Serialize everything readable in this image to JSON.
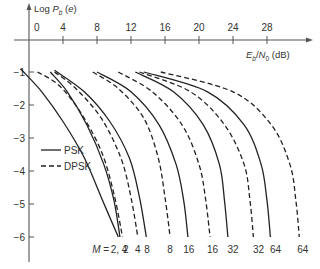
{
  "chart_data": {
    "type": "line",
    "title": "",
    "xlabel": "E_b/N_0 (dB)",
    "ylabel": "Log P_b (e)",
    "xlim": [
      0,
      32
    ],
    "ylim": [
      -6.5,
      0
    ],
    "x_ticks": [
      0,
      4,
      8,
      12,
      16,
      20,
      24,
      28
    ],
    "y_ticks": [
      -1,
      -2,
      -3,
      -4,
      -5,
      -6
    ],
    "grid": false,
    "legend": {
      "position": "left-middle",
      "entries": [
        {
          "label": "PSK",
          "style": "solid"
        },
        {
          "label": "DPSK",
          "style": "dashed"
        }
      ]
    },
    "bottom_label_prefix": "M = ",
    "series": [
      {
        "name": "PSK M=2",
        "style": "solid",
        "M": "2",
        "x": [
          -1.0,
          1.5,
          4.0,
          6.5,
          8.5,
          10.5
        ],
        "y": [
          -0.9,
          -1.6,
          -2.5,
          -3.6,
          -4.8,
          -6.0
        ]
      },
      {
        "name": "PSK M=4",
        "style": "solid",
        "M": "4",
        "x": [
          2.5,
          4.5,
          6.8,
          8.8,
          10.0,
          10.7
        ],
        "y": [
          -1.0,
          -1.6,
          -2.6,
          -3.8,
          -4.9,
          -6.0
        ]
      },
      {
        "name": "DPSK M=2",
        "style": "dashed",
        "M": "2",
        "x": [
          1.0,
          3.5,
          6.0,
          8.5,
          10.0,
          11.0
        ],
        "y": [
          -1.0,
          -1.4,
          -2.2,
          -3.4,
          -4.7,
          -6.0
        ]
      },
      {
        "name": "DPSK M=4",
        "style": "dashed",
        "M": "4",
        "x": [
          3.0,
          5.5,
          8.5,
          10.8,
          12.0,
          12.8
        ],
        "y": [
          -1.0,
          -1.5,
          -2.4,
          -3.6,
          -4.8,
          -6.0
        ]
      },
      {
        "name": "PSK M=8",
        "style": "solid",
        "M": "8",
        "x": [
          3.0,
          6.5,
          9.5,
          11.8,
          13.0,
          13.8
        ],
        "y": [
          -0.95,
          -1.6,
          -2.5,
          -3.6,
          -4.8,
          -6.0
        ]
      },
      {
        "name": "DPSK M=8",
        "style": "dashed",
        "M": "8",
        "x": [
          7.5,
          10.5,
          13.5,
          15.2,
          16.0,
          16.6
        ],
        "y": [
          -1.0,
          -1.5,
          -2.4,
          -3.6,
          -4.8,
          -6.0
        ]
      },
      {
        "name": "PSK M=16",
        "style": "solid",
        "M": "16",
        "x": [
          8.0,
          12.0,
          15.3,
          17.3,
          18.2,
          18.7
        ],
        "y": [
          -1.0,
          -1.6,
          -2.6,
          -3.8,
          -4.9,
          -6.0
        ]
      },
      {
        "name": "DPSK M=16",
        "style": "dashed",
        "M": "16",
        "x": [
          10.5,
          14.5,
          18.0,
          20.0,
          20.8,
          21.3
        ],
        "y": [
          -1.0,
          -1.6,
          -2.6,
          -3.8,
          -4.9,
          -6.0
        ]
      },
      {
        "name": "PSK M=32",
        "style": "solid",
        "M": "32",
        "x": [
          12.5,
          17.0,
          20.5,
          22.4,
          23.0,
          23.4
        ],
        "y": [
          -1.0,
          -1.6,
          -2.6,
          -3.8,
          -4.9,
          -6.0
        ]
      },
      {
        "name": "DPSK M=32",
        "style": "dashed",
        "M": "32",
        "x": [
          13.0,
          19.0,
          23.0,
          25.3,
          26.0,
          26.4
        ],
        "y": [
          -1.0,
          -1.6,
          -2.6,
          -3.8,
          -4.9,
          -6.0
        ]
      },
      {
        "name": "PSK M=64",
        "style": "solid",
        "M": "64",
        "x": [
          13.5,
          21.0,
          25.3,
          27.3,
          28.0,
          28.4
        ],
        "y": [
          -1.0,
          -1.6,
          -2.6,
          -3.8,
          -4.9,
          -6.0
        ]
      },
      {
        "name": "DPSK M=64",
        "style": "dashed",
        "M": "64",
        "x": [
          15.5,
          24.0,
          28.5,
          30.7,
          31.4,
          31.8
        ],
        "y": [
          -1.0,
          -1.6,
          -2.6,
          -3.8,
          -4.9,
          -6.0
        ]
      }
    ],
    "bottom_labels": [
      {
        "text": "2, 4",
        "x_dB": 10.6
      },
      {
        "text": "2",
        "x_dB": 11.4
      },
      {
        "text": "4",
        "x_dB": 12.8
      },
      {
        "text": "8",
        "x_dB": 13.9
      },
      {
        "text": "8",
        "x_dB": 16.6
      },
      {
        "text": "16",
        "x_dB": 18.8
      },
      {
        "text": "16",
        "x_dB": 21.6
      },
      {
        "text": "32",
        "x_dB": 24.0
      },
      {
        "text": "32",
        "x_dB": 27.0
      },
      {
        "text": "64",
        "x_dB": 29.0
      },
      {
        "text": "64",
        "x_dB": 32.2
      }
    ]
  },
  "labels": {
    "ylabel_main": "Log P",
    "ylabel_sub": "b",
    "ylabel_tail": " (e)",
    "xlabel_main": "E",
    "xlabel_sub1": "b",
    "xlabel_mid": "/N",
    "xlabel_sub2": "0",
    "xlabel_tail": " (dB)",
    "m_prefix": "M = ",
    "legend_psk": "PSK",
    "legend_dpsk": "DPSK"
  }
}
